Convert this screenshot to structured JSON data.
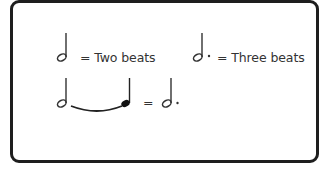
{
  "diagram": {
    "rows": [
      {
        "symbol": "half-note",
        "label": "= Two beats"
      },
      {
        "symbol": "dotted-half-note",
        "label": "= Three beats"
      }
    ],
    "tie_equation": {
      "left": [
        "half-note",
        "tie",
        "quarter-note"
      ],
      "equals": "=",
      "right": "dotted-half-note"
    },
    "colors": {
      "border": "#1e1e1e",
      "ink": "#333333",
      "background": "#ffffff"
    }
  }
}
